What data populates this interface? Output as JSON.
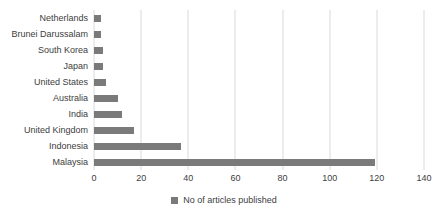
{
  "chart_data": {
    "type": "bar",
    "orientation": "horizontal",
    "categories": [
      "Netherlands",
      "Brunei Darussalam",
      "South Korea",
      "Japan",
      "United States",
      "Australia",
      "India",
      "United Kingdom",
      "Indonesia",
      "Malaysia"
    ],
    "values": [
      3,
      3,
      4,
      4,
      5,
      10,
      12,
      17,
      37,
      119
    ],
    "legend": "No of articles published",
    "legend_position": "bottom",
    "xlim": [
      0,
      140
    ],
    "xticks": [
      0,
      20,
      40,
      60,
      80,
      100,
      120,
      140
    ],
    "grid": "vertical",
    "bar_color": "#7a7a7a",
    "gridline_color": "#d9d9d9",
    "text_color": "#404040"
  }
}
